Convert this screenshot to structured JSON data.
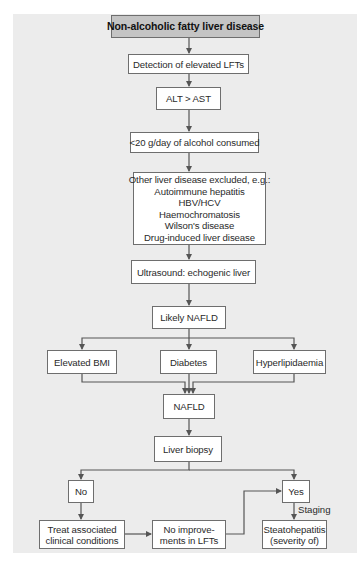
{
  "diagram": {
    "title": "Non-alcoholic fatty liver disease",
    "colors": {
      "title_fill": "#c4c4c4",
      "panel_bg": "#ececec",
      "box_fill": "#ffffff",
      "line": "#555555"
    },
    "nodes": {
      "detection": "Detection of elevated LFTs",
      "alt_ast": "ALT > AST",
      "alcohol": "<20 g/day of alcohol consumed",
      "other_liver": {
        "heading": "Other liver disease excluded, e.g.:",
        "items": [
          "Autoimmune hepatitis",
          "HBV/HCV",
          "Haemochromatosis",
          "Wilson's disease",
          "Drug-induced liver disease"
        ]
      },
      "ultrasound": "Ultrasound: echogenic liver",
      "likely_nafld": "Likely NAFLD",
      "elevated_bmi": "Elevated BMI",
      "diabetes": "Diabetes",
      "hyperlipidaemia": "Hyperlipidaemia",
      "nafld": "NAFLD",
      "liver_biopsy": "Liver biopsy",
      "no": "No",
      "yes": "Yes",
      "treat": [
        "Treat associated",
        "clinical conditions"
      ],
      "no_improvement": [
        "No improve-",
        "ments in LFTs"
      ],
      "steatohepatitis": [
        "Steatohepatitis",
        "(severity of)"
      ]
    },
    "edge_labels": {
      "staging": "Staging"
    }
  }
}
